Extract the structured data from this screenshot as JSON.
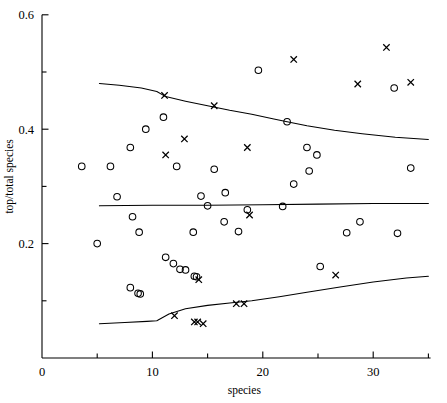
{
  "chart_data": {
    "type": "scatter",
    "title": "",
    "xlabel": "species",
    "ylabel": "top/total species",
    "xlim": [
      0,
      35.2
    ],
    "ylim": [
      0,
      0.6
    ],
    "grid": false,
    "legend": null,
    "x_ticks_major": [
      0,
      10,
      20,
      30
    ],
    "x_ticks_minor": [
      5,
      15,
      25,
      35
    ],
    "x_tick_labels": [
      "0",
      "10",
      "20",
      "30"
    ],
    "y_ticks_major": [
      0.2,
      0.4,
      0.6
    ],
    "y_ticks_minor": [
      0.1,
      0.3,
      0.5
    ],
    "y_tick_labels": [
      "0.2",
      "0.4",
      "0.6"
    ],
    "series": [
      {
        "name": "circle-points",
        "marker": "circle",
        "points": [
          [
            3.6,
            0.335
          ],
          [
            6.2,
            0.335
          ],
          [
            5.0,
            0.2
          ],
          [
            6.8,
            0.282
          ],
          [
            8.0,
            0.368
          ],
          [
            8.2,
            0.247
          ],
          [
            8.8,
            0.22
          ],
          [
            9.4,
            0.4
          ],
          [
            8.0,
            0.123
          ],
          [
            8.7,
            0.113
          ],
          [
            8.9,
            0.112
          ],
          [
            11.0,
            0.421
          ],
          [
            11.2,
            0.176
          ],
          [
            11.9,
            0.165
          ],
          [
            12.2,
            0.335
          ],
          [
            12.5,
            0.155
          ],
          [
            13.0,
            0.154
          ],
          [
            13.8,
            0.143
          ],
          [
            14.0,
            0.142
          ],
          [
            13.7,
            0.22
          ],
          [
            14.4,
            0.283
          ],
          [
            15.0,
            0.266
          ],
          [
            15.6,
            0.33
          ],
          [
            16.6,
            0.289
          ],
          [
            16.5,
            0.238
          ],
          [
            17.8,
            0.221
          ],
          [
            18.6,
            0.259
          ],
          [
            19.6,
            0.503
          ],
          [
            21.8,
            0.265
          ],
          [
            22.2,
            0.413
          ],
          [
            22.8,
            0.304
          ],
          [
            24.0,
            0.368
          ],
          [
            24.2,
            0.327
          ],
          [
            24.9,
            0.355
          ],
          [
            25.2,
            0.16
          ],
          [
            27.6,
            0.219
          ],
          [
            28.8,
            0.238
          ],
          [
            31.9,
            0.472
          ],
          [
            32.2,
            0.218
          ],
          [
            33.4,
            0.332
          ]
        ]
      },
      {
        "name": "cross-points",
        "marker": "cross",
        "points": [
          [
            11.1,
            0.459
          ],
          [
            11.2,
            0.355
          ],
          [
            12.0,
            0.074
          ],
          [
            12.9,
            0.383
          ],
          [
            13.8,
            0.063
          ],
          [
            14.1,
            0.063
          ],
          [
            14.2,
            0.137
          ],
          [
            14.6,
            0.06
          ],
          [
            15.6,
            0.441
          ],
          [
            17.6,
            0.095
          ],
          [
            18.3,
            0.095
          ],
          [
            18.6,
            0.368
          ],
          [
            18.8,
            0.25
          ],
          [
            22.8,
            0.522
          ],
          [
            26.6,
            0.145
          ],
          [
            28.6,
            0.479
          ],
          [
            31.2,
            0.543
          ],
          [
            33.4,
            0.482
          ]
        ]
      }
    ],
    "curves": [
      {
        "name": "upper-quantile-curve",
        "points": [
          [
            5.2,
            0.48
          ],
          [
            7.0,
            0.477
          ],
          [
            9.0,
            0.472
          ],
          [
            10.4,
            0.466
          ],
          [
            11.2,
            0.457
          ],
          [
            13.0,
            0.449
          ],
          [
            15.0,
            0.441
          ],
          [
            17.0,
            0.433
          ],
          [
            19.0,
            0.426
          ],
          [
            21.0,
            0.418
          ],
          [
            22.2,
            0.413
          ],
          [
            24.0,
            0.406
          ],
          [
            26.5,
            0.398
          ],
          [
            29.0,
            0.392
          ],
          [
            32.0,
            0.386
          ],
          [
            35.0,
            0.382
          ]
        ]
      },
      {
        "name": "median-curve",
        "points": [
          [
            5.2,
            0.266
          ],
          [
            10.0,
            0.267
          ],
          [
            15.0,
            0.267
          ],
          [
            20.0,
            0.268
          ],
          [
            25.0,
            0.269
          ],
          [
            30.0,
            0.27
          ],
          [
            35.0,
            0.27
          ]
        ]
      },
      {
        "name": "lower-quantile-curve",
        "points": [
          [
            5.2,
            0.06
          ],
          [
            7.5,
            0.062
          ],
          [
            9.5,
            0.064
          ],
          [
            10.4,
            0.065
          ],
          [
            11.5,
            0.077
          ],
          [
            13.0,
            0.086
          ],
          [
            15.0,
            0.092
          ],
          [
            17.0,
            0.096
          ],
          [
            19.0,
            0.1
          ],
          [
            21.5,
            0.107
          ],
          [
            24.0,
            0.115
          ],
          [
            27.0,
            0.124
          ],
          [
            30.0,
            0.133
          ],
          [
            33.0,
            0.14
          ],
          [
            35.0,
            0.143
          ]
        ]
      }
    ]
  }
}
